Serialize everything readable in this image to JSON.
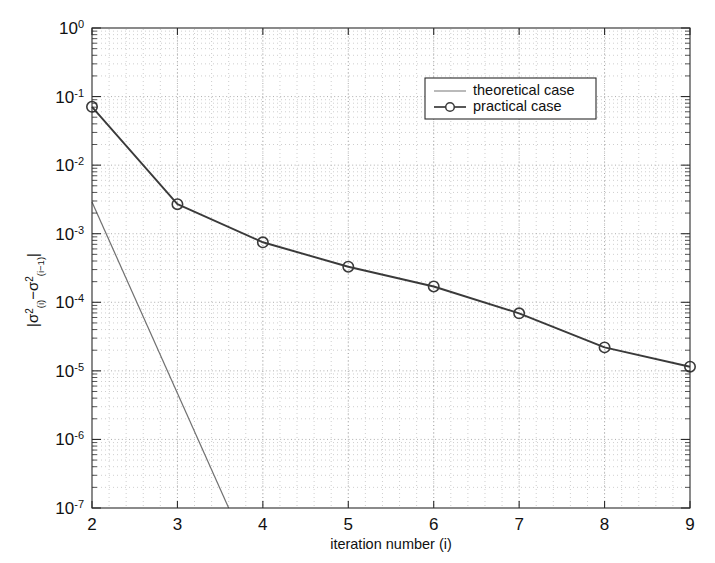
{
  "chart_data": {
    "type": "line",
    "title": "",
    "xlabel": "iteration number (i)",
    "ylabel": "|σ²(i) − σ²(i−1)|",
    "xlim": [
      2,
      9
    ],
    "ylim": [
      1e-07,
      1
    ],
    "yscale": "log",
    "xscale": "linear",
    "grid": true,
    "grid_style": "dotted",
    "legend_position": "upper-right",
    "x_ticks": [
      "2",
      "3",
      "4",
      "5",
      "6",
      "7",
      "8",
      "9"
    ],
    "y_ticks": [
      "10^0",
      "10^-1",
      "10^-2",
      "10^-3",
      "10^-4",
      "10^-5",
      "10^-6",
      "10^-7"
    ],
    "y_tick_mantissa": [
      "10",
      "10",
      "10",
      "10",
      "10",
      "10",
      "10",
      "10"
    ],
    "y_tick_exponents": [
      "0",
      "-1",
      "-2",
      "-3",
      "-4",
      "-5",
      "-6",
      "-7"
    ],
    "x": [
      2,
      3,
      4,
      5,
      6,
      7,
      8,
      9
    ],
    "series": [
      {
        "name": "theoretical case",
        "marker": "none",
        "color": "#707070",
        "x": [
          2,
          3.6
        ],
        "values": [
          0.0029,
          1e-07
        ]
      },
      {
        "name": "practical case",
        "marker": "circle",
        "color": "#3a3a3a",
        "x": [
          2,
          3,
          4,
          5,
          6,
          7,
          8,
          9
        ],
        "values": [
          0.071,
          0.0027,
          0.00075,
          0.00033,
          0.00017,
          6.9e-05,
          2.2e-05,
          1.15e-05
        ]
      }
    ]
  },
  "legend": {
    "entries": [
      {
        "label": "theoretical case",
        "marker": "line"
      },
      {
        "label": "practical case",
        "marker": "line-circle"
      }
    ]
  },
  "axes": {
    "x_axis_label": "iteration number (i)",
    "y_axis_label_parts": {
      "bar_open": "|",
      "sigma": "σ",
      "sup2": "2",
      "sub_i": "(i)",
      "minus": "−",
      "sub_i1": "(i−1)",
      "bar_close": "|"
    }
  },
  "colors": {
    "background": "#ffffff",
    "axis": "#2b2b2b",
    "grid_major": "#9a9a9a",
    "grid_minor": "#b9b9b9",
    "practical": "#3a3a3a",
    "theoretical": "#707070"
  }
}
